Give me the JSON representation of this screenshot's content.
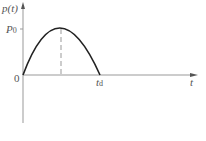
{
  "diagram": {
    "y_axis_label": "p(t)",
    "x_axis_label": "t",
    "peak_label": "P",
    "peak_label_sub": "0",
    "origin_label": "0",
    "duration_label": "t",
    "duration_label_sub": "d",
    "curve_type": "half-sine pulse",
    "colors": {
      "axis": "#888888",
      "curve": "#222222",
      "dashed": "#999999",
      "text": "#555555"
    }
  }
}
